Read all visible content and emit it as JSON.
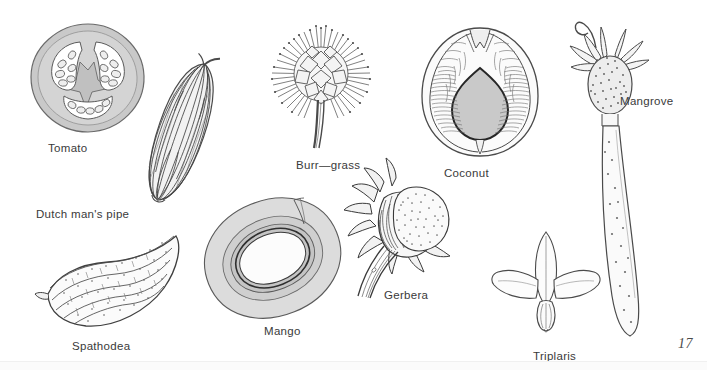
{
  "plate": {
    "page_number": "17",
    "background_color": "#ffffff",
    "ink_color": "#3a3a3a",
    "fill_gray": "#c9c9c9",
    "fill_light_gray": "#e2e2e2"
  },
  "figures": [
    {
      "id": "tomato",
      "label": "Tomato",
      "icon": "tomato-cross-section",
      "description": "Cross-section of a tomato fruit showing gray pericarp, three locules with white cavities and oval seeds",
      "label_x": 48,
      "label_y": 143,
      "fig_x": 28,
      "fig_y": 22
    },
    {
      "id": "dutchmans-pipe",
      "label": "Dutch man's pipe",
      "icon": "dutchmans-pipe-fruit",
      "description": "Elongated ribbed capsule with dense vertical striations, tilted diagonally",
      "label_x": 36,
      "label_y": 209,
      "fig_x": 126,
      "fig_y": 52
    },
    {
      "id": "burr-grass",
      "label": "Burr—grass",
      "icon": "burr-grass-spikelet",
      "description": "Spherical burr with radiating barbed bristles on a short stalk",
      "label_x": 296,
      "label_y": 160,
      "fig_x": 262,
      "fig_y": 24
    },
    {
      "id": "coconut",
      "label": "Coconut",
      "icon": "coconut-cross-section",
      "description": "Longitudinal section of coconut showing fibrous husk and gray teardrop-shaped seed cavity",
      "label_x": 444,
      "label_y": 168,
      "fig_x": 416,
      "fig_y": 22
    },
    {
      "id": "mangrove",
      "label": "Mangrove",
      "icon": "mangrove-propagule",
      "description": "Mangrove propagule with dotted seed head and long tapering hypocotyl bearing lenticels",
      "label_x": 620,
      "label_y": 96,
      "fig_x": 560,
      "fig_y": 14
    },
    {
      "id": "spathodea",
      "label": "Spathodea",
      "icon": "spathodea-pod",
      "description": "Curved boat-shaped ribbed pod with stippled ridges",
      "label_x": 72,
      "label_y": 341,
      "fig_x": 34,
      "fig_y": 232
    },
    {
      "id": "mango",
      "label": "Mango",
      "icon": "mango-cross-section",
      "description": "Cross-section of a mango with concentric gray rings around a pale central seed",
      "label_x": 264,
      "label_y": 326,
      "fig_x": 198,
      "fig_y": 196
    },
    {
      "id": "gerbera",
      "label": "Gerbera",
      "icon": "gerbera-flowerhead",
      "description": "Gerbera flower head with pointed bracts, stippled disc and curved striated stem",
      "label_x": 384,
      "label_y": 290,
      "fig_x": 340,
      "fig_y": 170
    },
    {
      "id": "triplaris",
      "label": "Triplaris",
      "icon": "triplaris-winged-fruit",
      "description": "Winged fruit with three elongated sepal wings above a rounded nut",
      "label_x": 533,
      "label_y": 351,
      "fig_x": 490,
      "fig_y": 228
    }
  ]
}
